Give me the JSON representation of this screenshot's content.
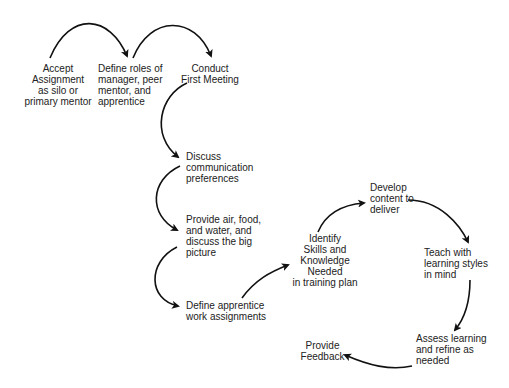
{
  "diagram": {
    "type": "process-flow",
    "nodes": [
      {
        "id": "accept",
        "lines": [
          "Accept",
          "Assignment",
          "as silo or",
          "primary mentor"
        ]
      },
      {
        "id": "define-roles",
        "lines": [
          "Define roles of",
          "manager, peer",
          "mentor, and",
          "apprentice"
        ]
      },
      {
        "id": "conduct",
        "lines": [
          "Conduct",
          "First Meeting"
        ]
      },
      {
        "id": "discuss",
        "lines": [
          "Discuss",
          "communication",
          "preferences"
        ]
      },
      {
        "id": "provide-air",
        "lines": [
          "Provide air, food,",
          "and water, and",
          "discuss the big",
          "picture"
        ]
      },
      {
        "id": "define-work",
        "lines": [
          "Define apprentice",
          "work assignments"
        ]
      },
      {
        "id": "identify",
        "lines": [
          "Identify",
          "Skills and",
          "Knowledge",
          "Needed",
          "in training plan"
        ]
      },
      {
        "id": "develop",
        "lines": [
          "Develop",
          "content to",
          "deliver"
        ]
      },
      {
        "id": "teach",
        "lines": [
          "Teach with",
          "learning styles",
          "in mind"
        ]
      },
      {
        "id": "assess",
        "lines": [
          "Assess learning",
          "and refine as",
          "needed"
        ]
      },
      {
        "id": "feedback",
        "lines": [
          "Provide",
          "Feedback"
        ]
      }
    ],
    "edges": [
      {
        "from": "accept",
        "to": "define-roles"
      },
      {
        "from": "define-roles",
        "to": "conduct"
      },
      {
        "from": "conduct",
        "to": "discuss"
      },
      {
        "from": "discuss",
        "to": "provide-air"
      },
      {
        "from": "provide-air",
        "to": "define-work"
      },
      {
        "from": "define-work",
        "to": "identify"
      },
      {
        "from": "identify",
        "to": "develop"
      },
      {
        "from": "develop",
        "to": "teach"
      },
      {
        "from": "teach",
        "to": "assess"
      },
      {
        "from": "assess",
        "to": "feedback"
      }
    ],
    "colors": {
      "arrow": "#111111",
      "text": "#222222",
      "background": "#ffffff"
    }
  }
}
